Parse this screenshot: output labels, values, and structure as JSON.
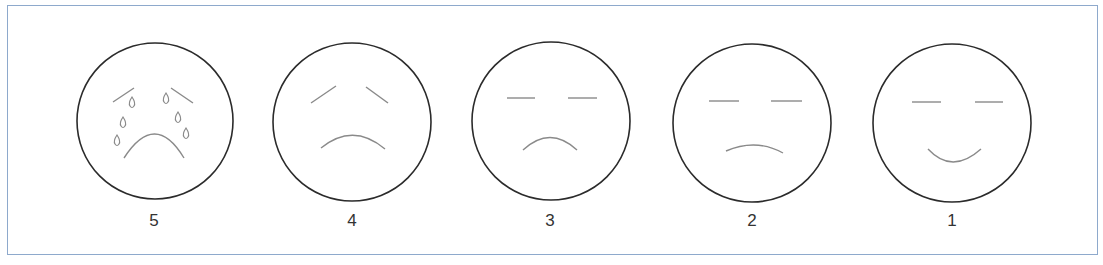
{
  "colors": {
    "frame": "#8ea9cc",
    "circle": "#2b2b2b",
    "feature": "#8a8a8a",
    "label": "#333333"
  },
  "faces": [
    {
      "label": "5",
      "expression": "crying",
      "cx": 155,
      "cy": 121
    },
    {
      "label": "4",
      "expression": "very-sad",
      "cx": 352,
      "cy": 122
    },
    {
      "label": "3",
      "expression": "sad",
      "cx": 551,
      "cy": 121
    },
    {
      "label": "2",
      "expression": "slightly-sad",
      "cx": 752,
      "cy": 123
    },
    {
      "label": "1",
      "expression": "happy",
      "cx": 952,
      "cy": 123
    }
  ]
}
